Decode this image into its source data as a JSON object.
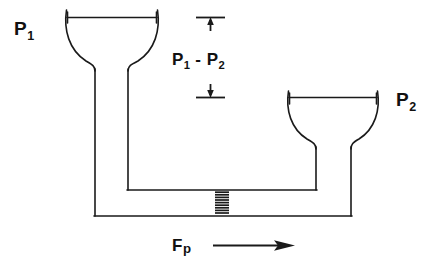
{
  "figure": {
    "background_color": "#ffffff",
    "line_color": "#1a1a1a",
    "width": 445,
    "height": 280
  },
  "labels": {
    "p1": {
      "base": "P",
      "sub": "1",
      "text": "P1"
    },
    "p2": {
      "base": "P",
      "sub": "2",
      "text": "P2"
    },
    "delta_p": {
      "base1": "P",
      "sub1": "1",
      "operator": " - ",
      "base2": "P",
      "sub2": "2",
      "text": "P1 - P2"
    },
    "force": {
      "base": "F",
      "sub": "p",
      "text": "Fp"
    }
  },
  "elements": {
    "left_funnel": {
      "name": "left-funnel-reservoir",
      "rim_y": 17,
      "rim_left_x": 66,
      "rim_right_x": 158
    },
    "right_funnel": {
      "name": "right-funnel-reservoir",
      "rim_y": 97,
      "rim_left_x": 288,
      "rim_right_x": 378
    },
    "inner_channel": {
      "name": "inner-channel",
      "bottom_y": 190,
      "left_x": 127,
      "right_x": 316
    },
    "outer_channel": {
      "name": "outer-channel",
      "bottom_y": 216,
      "left_x": 94,
      "right_x": 352
    },
    "porous_plug": {
      "name": "porous-plug",
      "center_x": 222,
      "top_y": 191,
      "bottom_y": 215,
      "dash_count": 10
    },
    "dimension_marker": {
      "name": "pressure-difference-dimension",
      "top_tick_y": 17,
      "bottom_tick_y": 97,
      "x": 211
    },
    "flow_arrow": {
      "name": "flow-direction-arrow",
      "y": 245,
      "start_x": 213,
      "end_x": 293,
      "direction": "right"
    }
  }
}
